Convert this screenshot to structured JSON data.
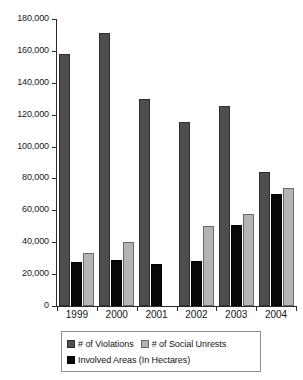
{
  "chart_data": {
    "type": "bar",
    "title": "",
    "subtitle": "",
    "xlabel": "",
    "ylabel": "",
    "categories": [
      "1999",
      "2000",
      "2001",
      "2002",
      "2003",
      "2004"
    ],
    "series": [
      {
        "name": "# of Violations",
        "color": "#4e4e4e",
        "values": [
          158000,
          171000,
          130000,
          115500,
          125500,
          84000
        ]
      },
      {
        "name": "Involved Areas (In Hectares)",
        "color": "#080808",
        "values": [
          27500,
          29000,
          26500,
          28000,
          51000,
          70000
        ]
      },
      {
        "name": "# of Social Unrests",
        "color": "#b3b3b3",
        "values": [
          33000,
          40000,
          0,
          50000,
          58000,
          74000
        ]
      }
    ],
    "ylim": [
      0,
      180000
    ],
    "ytick_step": 20000,
    "ytick_labels": [
      "180,000",
      "160,000",
      "140,000",
      "120,000",
      "100,000",
      "80,000",
      "60,000",
      "40,000",
      "20,000",
      "0"
    ],
    "ytick_values": [
      180000,
      160000,
      140000,
      120000,
      100000,
      80000,
      60000,
      40000,
      20000,
      0
    ],
    "grid": false,
    "legend_position": "bottom",
    "legend_entries": [
      {
        "label": "# of Violations",
        "swatch": "violations"
      },
      {
        "label": "# of Social Unrests",
        "swatch": "unrests"
      },
      {
        "label": "Involved Areas (In Hectares)",
        "swatch": "areas"
      }
    ]
  }
}
